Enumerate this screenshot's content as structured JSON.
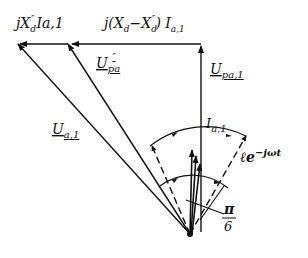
{
  "diagram": {
    "type": "phasor-diagram",
    "colors": {
      "ink": "#111111",
      "background": "#ffffff"
    },
    "labels": {
      "jxd_ia": "jX″d Ia,1",
      "jxd_ia_main": "jX",
      "jxd_ia_sup": "″",
      "jxd_ia_sub": "d",
      "jxd_ia_tail": "Ia,1",
      "diff_term": "j(Xd − X″d) Ia,1",
      "diff_main": "j(X",
      "diff_sub1": "d",
      "diff_mid": "−X",
      "diff_sup": "″",
      "diff_sub2": "d",
      "diff_tail": ") I",
      "diff_tail_sub": "a,1",
      "upa1": "U",
      "upa1_sub": "pa,1",
      "upa_sub_main": "U",
      "upa_sub": "pa",
      "upa_sup": "″",
      "ua1": "U",
      "ua1_sub": "a,1",
      "ia1": "I",
      "ia1_sub": "a,1",
      "rotation": "ℓe",
      "rotation_sup": "−jωt",
      "angle_num": "π",
      "angle_den": "6"
    },
    "phasors": [
      {
        "name": "Ua,1",
        "from": "origin",
        "to": "top-left",
        "role": "terminal voltage"
      },
      {
        "name": "U″pa",
        "from": "origin",
        "to": "top-mid",
        "role": "subtransient voltage"
      },
      {
        "name": "Upa,1",
        "from": "origin",
        "to": "top-right",
        "role": "vertical voltage"
      },
      {
        "name": "jX″d Ia,1",
        "from": "top-mid",
        "to": "top-left",
        "role": "horizontal drop"
      },
      {
        "name": "j(Xd−X″d) Ia,1",
        "from": "top-right",
        "to": "top-mid",
        "role": "horizontal drop"
      },
      {
        "name": "Ia,1",
        "from": "origin",
        "to": "up",
        "role": "current"
      }
    ],
    "angle_annotation": "π/6",
    "rotation_annotation": "ℓe^(−jωt)"
  }
}
